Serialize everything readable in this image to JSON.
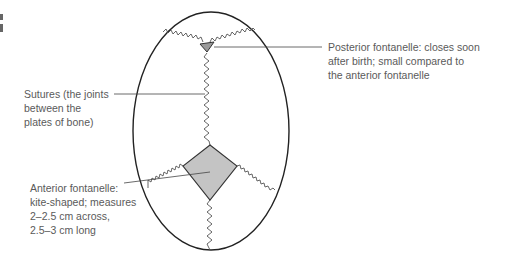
{
  "diagram": {
    "labels": {
      "posterior": {
        "lines": [
          "Posterior fontanelle: closes soon",
          "after birth; small compared to",
          "the anterior fontanelle"
        ]
      },
      "sutures": {
        "lines": [
          "Sutures (the joints",
          "between the",
          "plates of bone)"
        ]
      },
      "anterior": {
        "lines": [
          "Anterior fontanelle:",
          "kite-shaped; measures",
          "2–2.5 cm across,",
          "2.5–3 cm long"
        ]
      }
    },
    "colors": {
      "outline": "#222222",
      "suture": "#555555",
      "fontanelle_fill": "#c4c4c4",
      "leader": "#444444",
      "text": "#5a5a5a"
    }
  }
}
